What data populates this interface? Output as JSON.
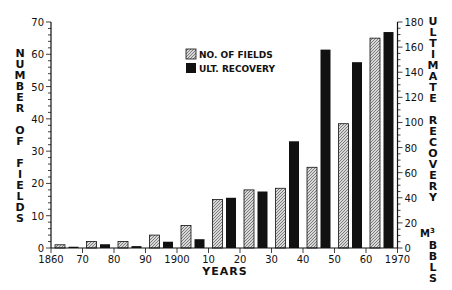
{
  "chart_data": {
    "type": "bar",
    "title": "",
    "xlabel": "YEARS",
    "ylabel": "NUMBER OF FIELDS",
    "y2label": "ULTIMATE RECOVERY M3 BBLS",
    "x_tick_labels": [
      "1860",
      "70",
      "80",
      "90",
      "1900",
      "10",
      "20",
      "30",
      "40",
      "50",
      "60",
      "1970"
    ],
    "categories": [
      "1860s",
      "1870s",
      "1880s",
      "1890s",
      "1900s",
      "1910s",
      "1920s",
      "1930s",
      "1940s",
      "1950s",
      "1960s"
    ],
    "series": [
      {
        "name": "NO. OF FIELDS",
        "axis": "left",
        "pattern": "hatched",
        "values": [
          1,
          2,
          2,
          4,
          7,
          15,
          18,
          18.5,
          25,
          38.5,
          65
        ]
      },
      {
        "name": "ULT. RECOVERY",
        "axis": "right",
        "pattern": "solid",
        "values": [
          1,
          3,
          1.5,
          5,
          7,
          40,
          45,
          85,
          158,
          148,
          172
        ]
      }
    ],
    "ylim": [
      0,
      70
    ],
    "y_ticks": [
      0,
      10,
      20,
      30,
      40,
      50,
      60,
      70
    ],
    "y2lim": [
      0,
      180
    ],
    "y2_ticks": [
      0,
      20,
      40,
      60,
      80,
      100,
      120,
      140,
      160,
      180
    ],
    "xlim": [
      1860,
      1970
    ],
    "grid": false,
    "legend_position": "upper center"
  },
  "legend": {
    "fields_label": "NO. OF FIELDS",
    "recovery_label": "ULT. RECOVERY"
  },
  "axes": {
    "left_label": "NUMBER OF FIELDS",
    "right_label_top": "ULTIMATE RECOVERY",
    "right_unit": "M3",
    "right_label_bottom": "BBLS",
    "x_title": "YEARS"
  },
  "colors": {
    "ink": "#111111",
    "hatch_bg": "#d8d8d8",
    "background": "#ffffff"
  }
}
